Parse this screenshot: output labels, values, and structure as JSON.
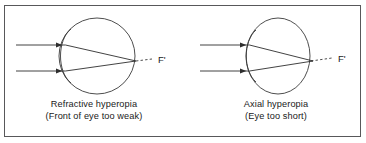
{
  "figure": {
    "background_color": "#ffffff",
    "border_color": "#58585a",
    "ink_color": "#3a3a3a",
    "text_color": "#1a1a1a"
  },
  "diagrams": [
    {
      "id": "refractive-hyperopia",
      "caption_line1": "Refractive hyperopia",
      "caption_line2": "(Front of eye too weak)",
      "focal_point_label": "F'",
      "eye_shape": "circle",
      "ray_count": 2,
      "ray_direction": "left-to-right",
      "focus_location": "behind retina"
    },
    {
      "id": "axial-hyperopia",
      "caption_line1": "Axial hyperopia",
      "caption_line2": "(Eye too short)",
      "focal_point_label": "F'",
      "eye_shape": "ellipse-vertical",
      "ray_count": 2,
      "ray_direction": "left-to-right",
      "focus_location": "behind retina"
    }
  ]
}
